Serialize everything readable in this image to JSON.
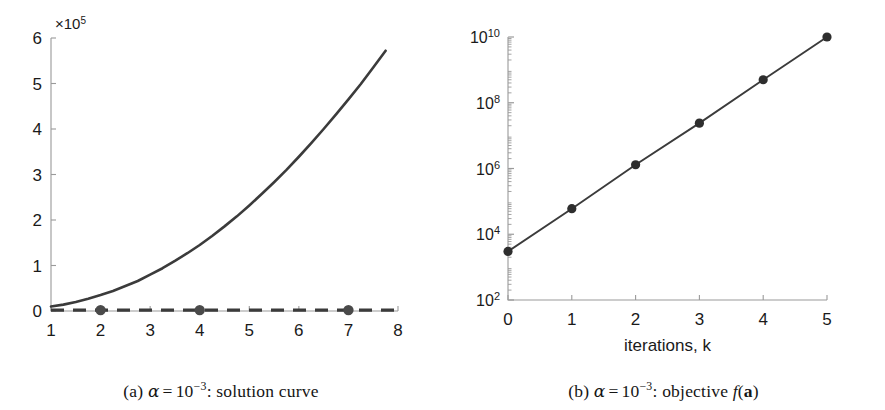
{
  "figure": {
    "background_color": "#ffffff",
    "line_color": "#3b3b3b",
    "marker_color": "#4a4a4a",
    "axis_color": "#9a9a9a",
    "text_color": "#1a1a1a"
  },
  "panel_a": {
    "caption": {
      "index": "(a)",
      "alpha": "α",
      "equals": "=",
      "base": "10",
      "exponent": "−3",
      "colon": ":",
      "description": "solution curve",
      "full_text": "(a) α = 10−3: solution curve"
    },
    "multiplier_label": {
      "times": "×",
      "base": "10",
      "exponent": "5",
      "full_text": "×10⁵"
    },
    "x_tick_labels": [
      "1",
      "2",
      "3",
      "4",
      "5",
      "6",
      "7",
      "8"
    ],
    "y_tick_labels": [
      "0",
      "1",
      "2",
      "3",
      "4",
      "5",
      "6"
    ]
  },
  "panel_b": {
    "caption": {
      "index": "(b)",
      "alpha": "α",
      "equals": "=",
      "base": "10",
      "exponent": "−3",
      "colon": ":",
      "description_pre": "objective",
      "fn": "f",
      "arg_open": "(",
      "arg": "a",
      "arg_close": ")",
      "full_text": "(b) α = 10−3: objective f(a)"
    },
    "x_axis_title": "iterations, k",
    "x_tick_labels": [
      "0",
      "1",
      "2",
      "3",
      "4",
      "5"
    ],
    "y_tick_labels": [
      "10²",
      "10⁴",
      "10⁶",
      "10⁸",
      "10¹⁰"
    ]
  },
  "chart_data": [
    {
      "type": "line",
      "id": "panel-a-solution-curve",
      "title": "(a) α = 10⁻³: solution curve",
      "xlabel": "",
      "ylabel": "",
      "y_multiplier": 100000,
      "y_multiplier_label": "×10⁵",
      "xlim": [
        1,
        8
      ],
      "ylim": [
        0,
        6
      ],
      "xticks": [
        1,
        2,
        3,
        4,
        5,
        6,
        7,
        8
      ],
      "yticks": [
        0,
        1,
        2,
        3,
        4,
        5,
        6
      ],
      "grid": false,
      "legend": "none",
      "series": [
        {
          "name": "solution curve",
          "style": "solid",
          "color": "#3b3b3b",
          "x": [
            1,
            1.25,
            1.5,
            1.75,
            2,
            2.25,
            2.5,
            2.75,
            3,
            3.25,
            3.5,
            3.75,
            4,
            4.25,
            4.5,
            4.75,
            5,
            5.25,
            5.5,
            5.75,
            6,
            6.25,
            6.5,
            6.75,
            7,
            7.25,
            7.5,
            7.75,
            8
          ],
          "y": [
            0.1,
            0.14,
            0.2,
            0.27,
            0.35,
            0.44,
            0.55,
            0.66,
            0.8,
            0.94,
            1.1,
            1.27,
            1.45,
            1.65,
            1.86,
            2.08,
            2.32,
            2.57,
            2.83,
            3.1,
            3.39,
            3.69,
            4.0,
            4.32,
            4.65,
            4.99,
            5.35,
            5.72,
            5.2
          ],
          "y_units": "×10⁵"
        },
        {
          "name": "baseline",
          "style": "dashed",
          "color": "#3b3b3b",
          "x": [
            1,
            8
          ],
          "y": [
            0.02,
            0.02
          ],
          "markers_at_x": [
            2,
            4,
            7
          ],
          "marker_shape": "circle",
          "marker_color": "#4a4a4a"
        }
      ]
    },
    {
      "type": "line",
      "id": "panel-b-objective",
      "title": "(b) α = 10⁻³: objective f(a)",
      "xlabel": "iterations, k",
      "ylabel": "",
      "yscale": "log",
      "xlim": [
        0,
        5
      ],
      "ylim": [
        100,
        10000000000
      ],
      "xticks": [
        0,
        1,
        2,
        3,
        4,
        5
      ],
      "yticks": [
        100,
        10000,
        1000000,
        100000000,
        10000000000
      ],
      "ytick_labels": [
        "10²",
        "10⁴",
        "10⁶",
        "10⁸",
        "10¹⁰"
      ],
      "grid": false,
      "legend": "none",
      "series": [
        {
          "name": "objective f(a)",
          "style": "solid",
          "color": "#3b3b3b",
          "marker_shape": "circle",
          "marker_color": "#2e2e2e",
          "x": [
            0,
            1,
            2,
            3,
            4,
            5
          ],
          "y": [
            3000,
            60000,
            1300000,
            24000000,
            500000000,
            10000000000
          ]
        }
      ]
    }
  ]
}
